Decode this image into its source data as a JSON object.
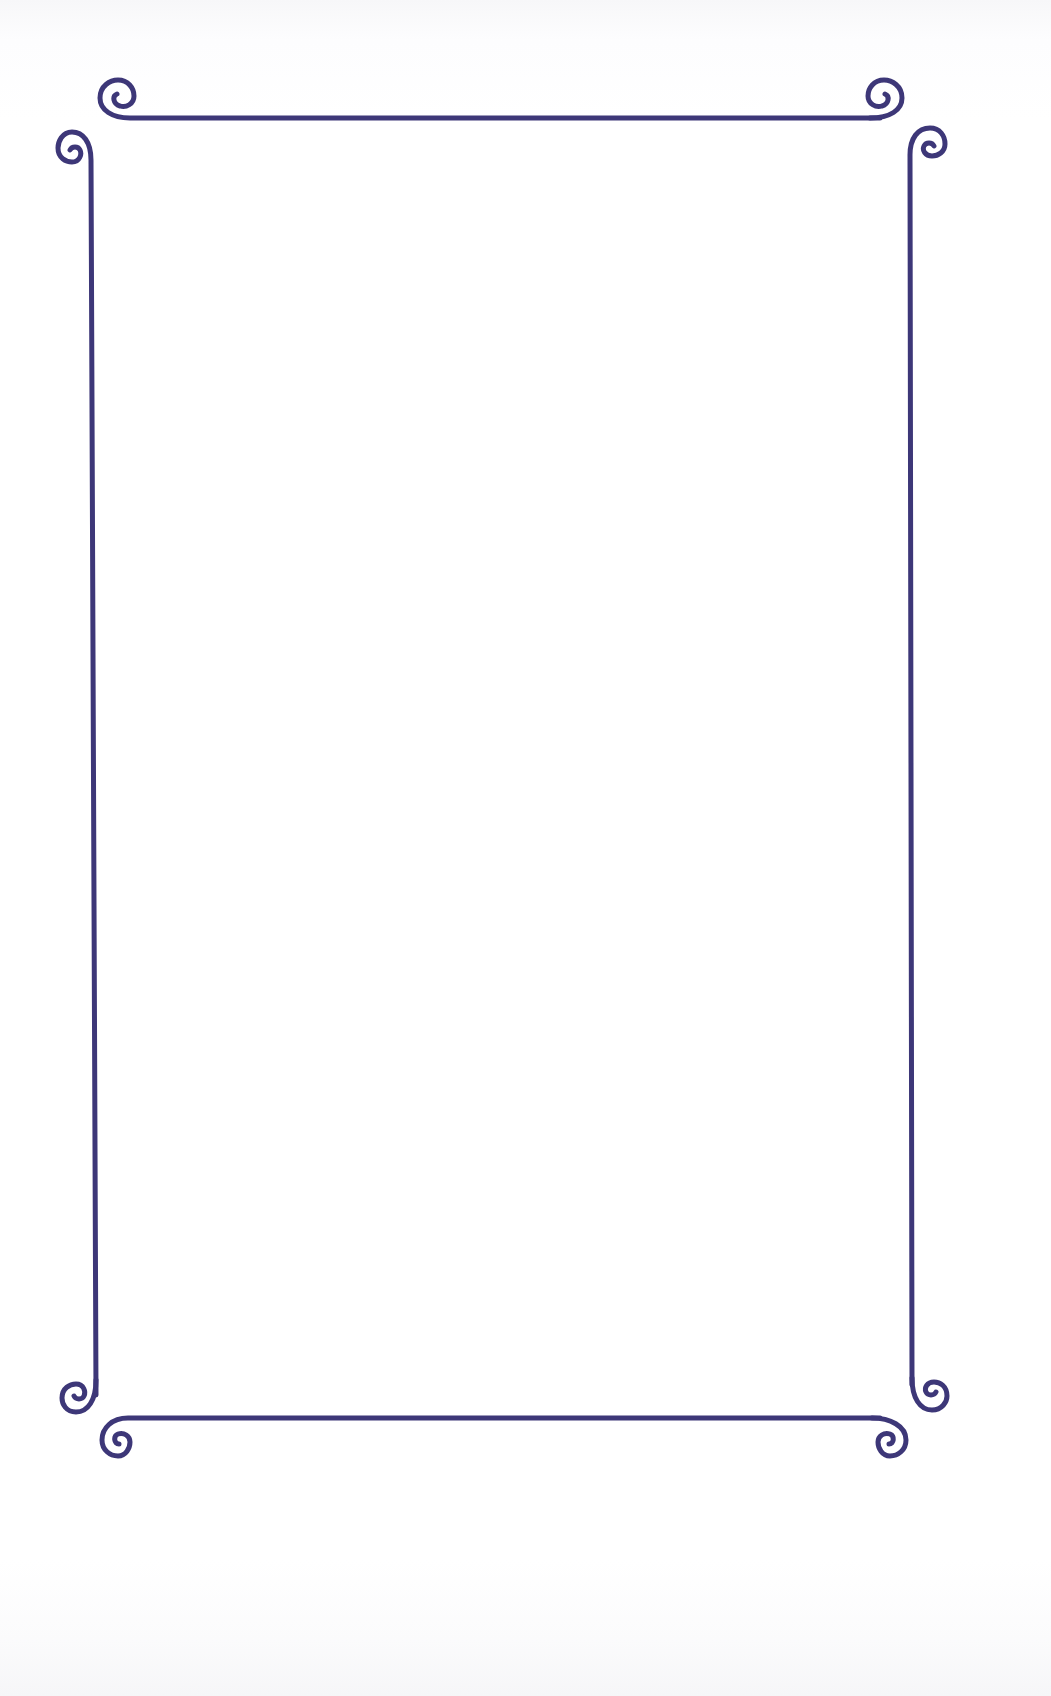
{
  "page": {
    "type": "decorative-border-paper",
    "background_color": "#ffffff",
    "title": "",
    "body": ""
  },
  "frame": {
    "style": "scroll-corner border",
    "stroke_color": "#3d3778",
    "stroke_width": 5,
    "corner_ornament_icon": "spiral-scroll-icon",
    "sides": [
      "top",
      "right",
      "bottom",
      "left"
    ],
    "corners": [
      "top-left",
      "top-right",
      "bottom-left",
      "bottom-right"
    ]
  }
}
